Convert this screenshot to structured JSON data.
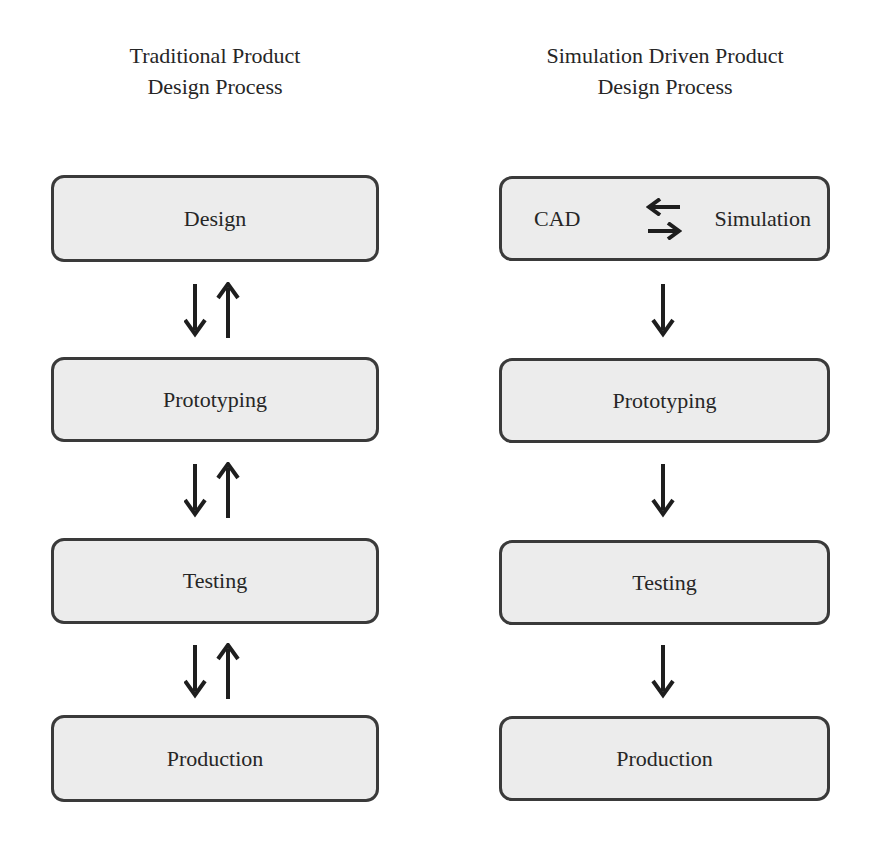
{
  "diagram": {
    "colors": {
      "box_fill": "#ececec",
      "box_border": "#3a3a3a",
      "arrow": "#1e1e1e",
      "text": "#262626",
      "background": "#ffffff"
    },
    "left": {
      "title_line1": "Traditional Product",
      "title_line2": "Design Process",
      "steps": [
        {
          "label": "Design"
        },
        {
          "label": "Prototyping"
        },
        {
          "label": "Testing"
        },
        {
          "label": "Production"
        }
      ],
      "connectors": [
        {
          "from": "Design",
          "to": "Prototyping",
          "type": "bidirectional"
        },
        {
          "from": "Prototyping",
          "to": "Testing",
          "type": "bidirectional"
        },
        {
          "from": "Testing",
          "to": "Production",
          "type": "bidirectional"
        }
      ]
    },
    "right": {
      "title_line1": "Simulation Driven Product",
      "title_line2": "Design Process",
      "steps": [
        {
          "label_left": "CAD",
          "label_right": "Simulation",
          "internal_connector": "bidirectional"
        },
        {
          "label": "Prototyping"
        },
        {
          "label": "Testing"
        },
        {
          "label": "Production"
        }
      ],
      "connectors": [
        {
          "from": "CAD/Simulation",
          "to": "Prototyping",
          "type": "down"
        },
        {
          "from": "Prototyping",
          "to": "Testing",
          "type": "down"
        },
        {
          "from": "Testing",
          "to": "Production",
          "type": "down"
        }
      ]
    }
  }
}
